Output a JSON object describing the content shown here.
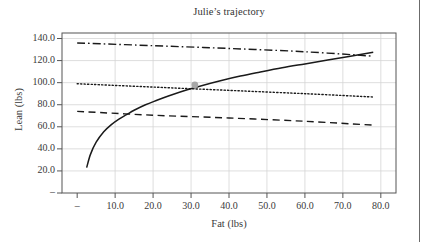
{
  "figure": {
    "title": "Julie’s trajectory",
    "page_rule": "column-divider"
  },
  "chart_data": {
    "type": "line",
    "title": "Julie’s trajectory",
    "xlabel": "Fat (lbs)",
    "ylabel": "Lean (lbs)",
    "xlim": [
      -4.0,
      84.0
    ],
    "ylim": [
      0.0,
      145.0
    ],
    "grid": true,
    "legend": "none",
    "xticks": [
      "–",
      "10.0",
      "20.0",
      "30.0",
      "40.0",
      "50.0",
      "60.0",
      "70.0",
      "80.0"
    ],
    "xtick_values": [
      0,
      10,
      20,
      30,
      40,
      50,
      60,
      70,
      80
    ],
    "yticks": [
      "–",
      "20.0",
      "40.0",
      "60.0",
      "80.0",
      "100.0",
      "120.0",
      "140.0"
    ],
    "ytick_values": [
      0,
      20,
      40,
      60,
      80,
      100,
      120,
      140
    ],
    "series": [
      {
        "name": "trajectory",
        "style": "solid",
        "color": "#1a1a1a",
        "x": [
          2.5,
          3.5,
          5.0,
          7.0,
          9.0,
          11.0,
          13.0,
          15.0,
          18.0,
          21.0,
          25.0,
          29.0,
          33.0,
          38.0,
          43.0,
          48.0,
          54.0,
          60.0,
          66.0,
          72.0,
          78.0
        ],
        "y": [
          23.0,
          35.0,
          46.0,
          55.5,
          62.0,
          67.0,
          71.0,
          75.0,
          80.0,
          84.0,
          89.0,
          93.5,
          97.5,
          102.0,
          106.0,
          109.5,
          113.5,
          117.0,
          120.5,
          124.0,
          127.5
        ]
      },
      {
        "name": "upper-band",
        "style": "dashdot",
        "color": "#1a1a1a",
        "x": [
          0.0,
          20.0,
          40.0,
          60.0,
          78.0
        ],
        "y": [
          136.0,
          133.5,
          131.0,
          128.0,
          124.0
        ]
      },
      {
        "name": "middle-band",
        "style": "dotted",
        "color": "#1a1a1a",
        "x": [
          0.0,
          20.0,
          40.0,
          60.0,
          78.0
        ],
        "y": [
          99.0,
          96.0,
          93.0,
          90.0,
          87.0
        ]
      },
      {
        "name": "lower-band",
        "style": "dashed",
        "color": "#1a1a1a",
        "x": [
          0.0,
          20.0,
          40.0,
          60.0,
          78.0
        ],
        "y": [
          74.0,
          70.5,
          68.0,
          65.0,
          61.5
        ]
      }
    ],
    "markers": [
      {
        "name": "current-point",
        "x": 31.0,
        "y": 98.0,
        "color": "#a8a8a8",
        "shape": "circle"
      }
    ],
    "colors": {
      "line": "#1a1a1a",
      "grid": "#d6d6d6",
      "axis": "#555555",
      "marker": "#a8a8a8"
    }
  }
}
